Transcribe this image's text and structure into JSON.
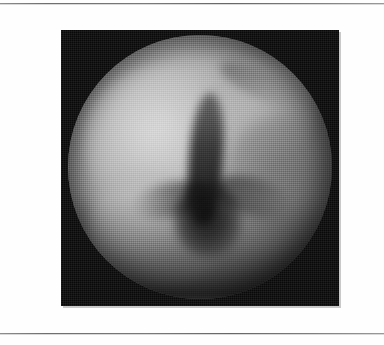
{
  "page": {
    "background_color": "#fefefe",
    "rule_color": "#7a7a7a",
    "top_rule_label": "page-top-rule",
    "bottom_rule_label": "page-bottom-rule"
  },
  "figure": {
    "plate_background_color": "#090909",
    "plate_shadow_color": "#c9c9c9",
    "caption": "",
    "modality_label": "",
    "field_of_view": {
      "shape": "circle",
      "center_x_px": 200,
      "center_y_px": 166,
      "radius_px": 132,
      "bright_tone": "#cfcfcf",
      "mid_tone": "#9d9d9d",
      "dark_tone": "#141414"
    },
    "features": [
      {
        "name": "mucosal-highlight-upper-left",
        "tone": "#dcdcdc"
      },
      {
        "name": "mucosal-highlight-lower-left",
        "tone": "#cdcdcd"
      },
      {
        "name": "mucosal-highlight-upper-right",
        "tone": "#c4c4c4"
      },
      {
        "name": "wall-fold-right",
        "tone": "#464646"
      },
      {
        "name": "bronchial-lumen-trunk",
        "tone": "#1a1a1a"
      },
      {
        "name": "bronchial-lumen-pool",
        "tone": "#0c0c0c"
      },
      {
        "name": "carina-branch-left",
        "tone": "#2d2d2d"
      },
      {
        "name": "carina-branch-right",
        "tone": "#1e1e1e"
      },
      {
        "name": "groove-upper-right",
        "tone": "#3c3c3c"
      }
    ]
  }
}
